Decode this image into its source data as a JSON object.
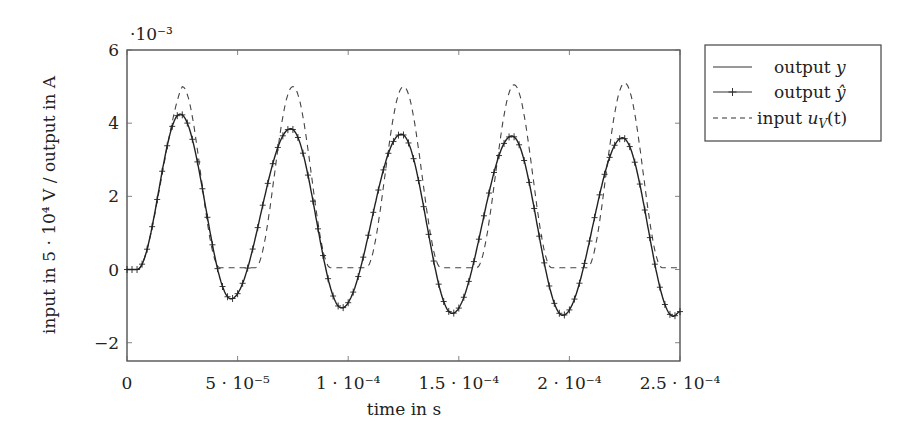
{
  "chart_data": {
    "type": "line",
    "title": "",
    "xlabel": "time in s",
    "ylabel": "input in 5 · 10⁴ V / output in A",
    "y_scale_note": "·10⁻³",
    "xlim": [
      0,
      0.00025
    ],
    "ylim": [
      -2.5,
      6
    ],
    "grid": false,
    "legend_position": "outside-right-top",
    "x_ticks": [
      0,
      5e-05,
      0.0001,
      0.00015,
      0.0002,
      0.00025
    ],
    "x_tick_labels": [
      "0",
      "5 · 10⁻⁵",
      "1 · 10⁻⁴",
      "1.5 · 10⁻⁴",
      "2 · 10⁻⁴",
      "2.5 · 10⁻⁴"
    ],
    "y_ticks": [
      -2,
      0,
      2,
      4,
      6
    ],
    "y_tick_labels": [
      "−2",
      "0",
      "2",
      "4",
      "6"
    ],
    "period_s": 5e-05,
    "series": [
      {
        "name": "output y",
        "style": "solid",
        "peaks": [
          {
            "t": 2.4e-05,
            "v": 4.25
          },
          {
            "t": 7.4e-05,
            "v": 3.85
          },
          {
            "t": 0.000124,
            "v": 3.7
          },
          {
            "t": 0.000174,
            "v": 3.65
          },
          {
            "t": 0.000224,
            "v": 3.6
          }
        ],
        "troughs": [
          {
            "t": 4.7e-05,
            "v": -0.8
          },
          {
            "t": 9.7e-05,
            "v": -1.05
          },
          {
            "t": 0.000147,
            "v": -1.2
          },
          {
            "t": 0.000197,
            "v": -1.25
          },
          {
            "t": 0.000247,
            "v": -1.28
          }
        ],
        "start_value": 0,
        "end_value": -1.15
      },
      {
        "name": "output ŷ",
        "style": "solid-with-plus-markers",
        "note": "overlaps output y almost exactly"
      },
      {
        "name": "input u_V(t)",
        "style": "dashed",
        "peaks": [
          {
            "t": 2.5e-05,
            "v": 5.0
          },
          {
            "t": 7.5e-05,
            "v": 5.0
          },
          {
            "t": 0.000125,
            "v": 5.0
          },
          {
            "t": 0.000175,
            "v": 5.05
          },
          {
            "t": 0.000225,
            "v": 5.1
          }
        ],
        "trough_value": 0.05,
        "start_value": 0
      }
    ],
    "legend": [
      {
        "label_main": "output ",
        "label_var": "y",
        "style": "solid"
      },
      {
        "label_main": "output ",
        "label_var": "ŷ",
        "style": "marker"
      },
      {
        "label_main": "input ",
        "label_var": "u",
        "label_sub": "V",
        "label_tail": "(t)",
        "style": "dashed"
      }
    ]
  }
}
